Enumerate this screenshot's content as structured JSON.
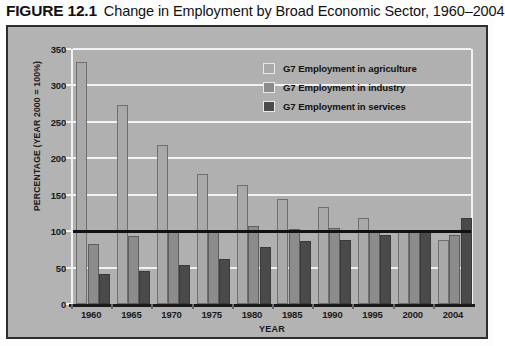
{
  "caption": {
    "figure_number": "FIGURE 12.1",
    "title": "Change in Employment by Broad Economic Sector, 1960–2004"
  },
  "colors": {
    "background": "#b3b3b3",
    "plot_background": "#b0b0b0",
    "gridline": "#f2f2f2",
    "frame_border": "#2e2e2e",
    "axis": "#1a1a1a",
    "reference_line": "#111111",
    "series_agriculture": "#a9a9a9",
    "series_industry": "#8c8c8c",
    "series_services": "#4a4a4a"
  },
  "legend": {
    "position": "top-right",
    "items": [
      {
        "label": "G7 Employment in agriculture",
        "color": "#a9a9a9"
      },
      {
        "label": "G7 Employment in industry",
        "color": "#8c8c8c"
      },
      {
        "label": "G7 Employment in services",
        "color": "#4a4a4a"
      }
    ]
  },
  "chart_data": {
    "type": "bar",
    "title": "Change in Employment by Broad Economic Sector, 1960–2004",
    "xlabel": "YEAR",
    "ylabel": "PERCENTAGE (YEAR 2000 = 100%)",
    "categories": [
      "1960",
      "1965",
      "1970",
      "1975",
      "1980",
      "1985",
      "1990",
      "1995",
      "2000",
      "2004"
    ],
    "series": [
      {
        "name": "G7 Employment in agriculture",
        "color": "#a9a9a9",
        "values": [
          332,
          273,
          218,
          179,
          164,
          144,
          133,
          118,
          100,
          88
        ]
      },
      {
        "name": "G7 Employment in industry",
        "color": "#8c8c8c",
        "values": [
          83,
          94,
          102,
          101,
          107,
          103,
          104,
          100,
          100,
          95
        ]
      },
      {
        "name": "G7 Employment in services",
        "color": "#4a4a4a",
        "values": [
          41,
          46,
          54,
          62,
          78,
          86,
          88,
          95,
          100,
          118
        ]
      }
    ],
    "ylim": [
      0,
      350
    ],
    "yticks": [
      0,
      50,
      100,
      150,
      200,
      250,
      300,
      350
    ],
    "grid": true,
    "reference_line": {
      "value": 100,
      "color": "#111111"
    }
  }
}
